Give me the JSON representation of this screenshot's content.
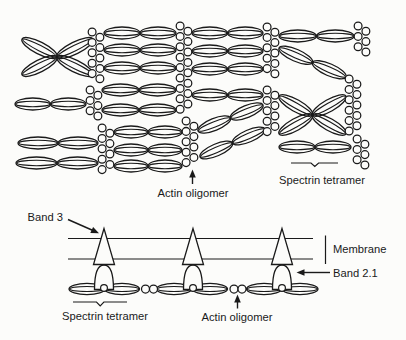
{
  "colors": {
    "ink": "#1a1a1a",
    "background": "#fcfcfa"
  },
  "top_panel": {
    "name": "spectrin-actin network (face view)",
    "labels": {
      "actin_oligomer": "Actin oligomer",
      "spectrin_tetramer": "Spectrin tetramer"
    }
  },
  "bottom_panel": {
    "name": "membrane cross-section (side view)",
    "labels": {
      "band_3": "Band 3",
      "membrane": "Membrane",
      "band_2_1": "Band 2.1",
      "spectrin_tetramer": "Spectrin tetramer",
      "actin_oligomer": "Actin oligomer"
    }
  }
}
